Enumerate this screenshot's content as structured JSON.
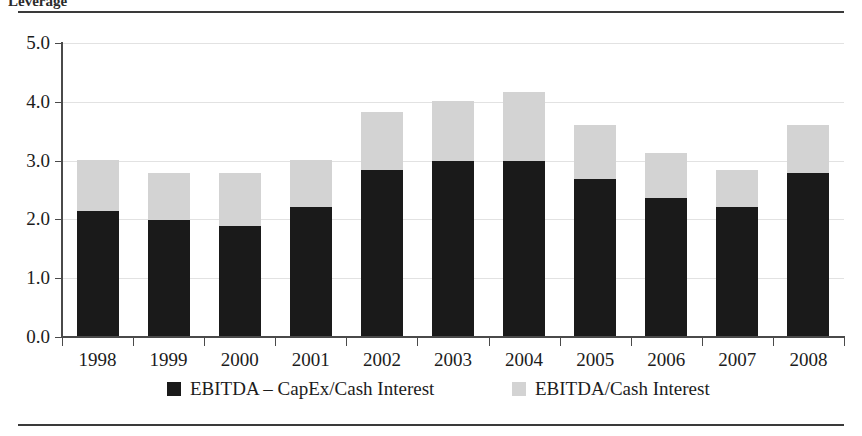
{
  "figure": {
    "clipped_caption": "Leverage"
  },
  "chart_data": {
    "type": "bar",
    "stacked": true,
    "title": "",
    "subtitle": "",
    "xlabel": "",
    "ylabel": "",
    "ylim": [
      0.0,
      5.0
    ],
    "ytick_labels": [
      "5.0",
      "4.0",
      "3.0",
      "2.0",
      "1.0",
      "0.0"
    ],
    "ytick_values": [
      5.0,
      4.0,
      3.0,
      2.0,
      1.0,
      0.0
    ],
    "grid": true,
    "grid_axis": "y",
    "legend_position": "bottom",
    "categories": [
      "1998",
      "1999",
      "2000",
      "2001",
      "2002",
      "2003",
      "2004",
      "2005",
      "2006",
      "2007",
      "2008"
    ],
    "series": [
      {
        "name": "EBITDA – CapEx/Cash Interest",
        "color": "#1a1a1a",
        "values": [
          2.14,
          1.99,
          1.89,
          2.21,
          2.84,
          2.99,
          2.99,
          2.69,
          2.36,
          2.21,
          2.79
        ]
      },
      {
        "name": "EBITDA/Cash Interest",
        "color": "#d3d3d3",
        "values": [
          3.01,
          2.79,
          2.79,
          3.01,
          3.83,
          4.01,
          4.17,
          3.61,
          3.13,
          2.84,
          3.61
        ],
        "note": "total bar height (series drawn as remainder above the black segment)"
      }
    ]
  },
  "legend": {
    "items": [
      {
        "label": "EBITDA – CapEx/Cash Interest",
        "color": "#1a1a1a"
      },
      {
        "label": "EBITDA/Cash Interest",
        "color": "#d3d3d3"
      }
    ]
  }
}
